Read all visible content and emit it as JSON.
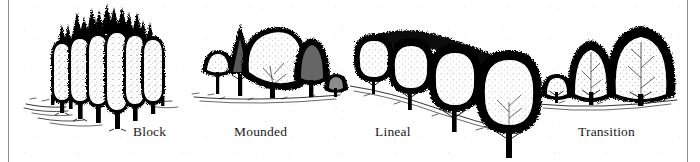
{
  "plate": {
    "kind": "pen-and-ink illustration plate",
    "background_color": "#ffffff",
    "ink_color": "#000000",
    "rule_color": "#8d8d8d",
    "width": 700,
    "height": 162
  },
  "figures": [
    {
      "id": "block",
      "caption": "Block",
      "description": "Dense rectangular massing of many columnar trees planted in several rows",
      "caption_x": 133,
      "caption_y": 124
    },
    {
      "id": "mounded",
      "caption": "Mounded",
      "description": "Cluster of trees graded from low at the edges to a tall rounded crown at the centre",
      "caption_x": 234,
      "caption_y": 124
    },
    {
      "id": "lineal",
      "caption": "Lineal",
      "description": "Single row of rounded trees receding in perspective",
      "caption_x": 375,
      "caption_y": 124
    },
    {
      "id": "transition",
      "caption": "Transition",
      "description": "Trees stepping up in height from small to large",
      "caption_x": 578,
      "caption_y": 124
    }
  ]
}
